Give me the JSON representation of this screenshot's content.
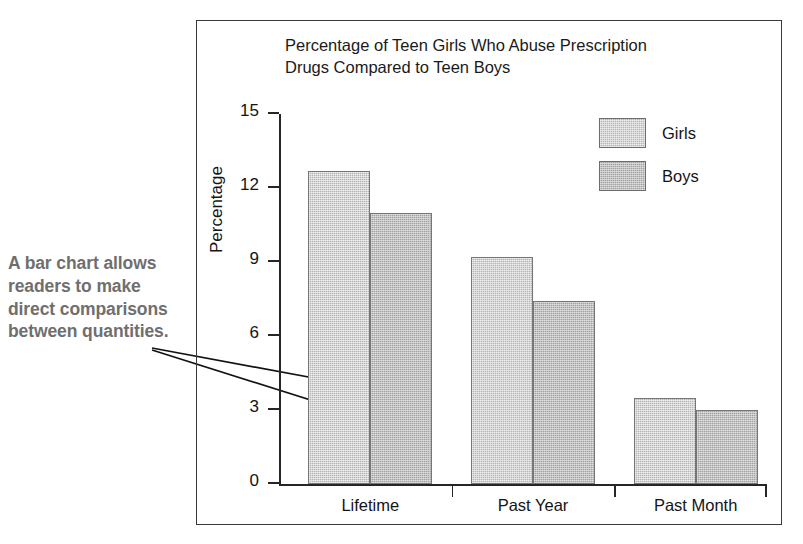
{
  "annotation": {
    "text": "A bar chart allows readers to make direct comparisons between quantities.",
    "color": "#6f6f6f"
  },
  "chart_data": {
    "type": "bar",
    "title": "Percentage of Teen Girls Who Abuse Prescription Drugs Compared to Teen Boys",
    "title_line1": "Percentage of Teen Girls Who Abuse Prescription",
    "title_line2": "Drugs Compared to Teen Boys",
    "xlabel": "",
    "ylabel": "Percentage",
    "categories": [
      "Lifetime",
      "Past Year",
      "Past Month"
    ],
    "series": [
      {
        "name": "Girls",
        "values": [
          12.7,
          9.2,
          3.5
        ],
        "color": "#b4b4b4"
      },
      {
        "name": "Boys",
        "values": [
          11.0,
          7.4,
          3.0
        ],
        "color": "#a2a2a2"
      }
    ],
    "ylim": [
      0,
      15
    ],
    "yticks": [
      0,
      3,
      6,
      9,
      12,
      15
    ],
    "ytick_labels": [
      "0",
      "3",
      "6",
      "9",
      "12",
      "15"
    ],
    "grid": false,
    "legend_position": "top-right",
    "legend_entries": [
      "Girls",
      "Boys"
    ]
  }
}
